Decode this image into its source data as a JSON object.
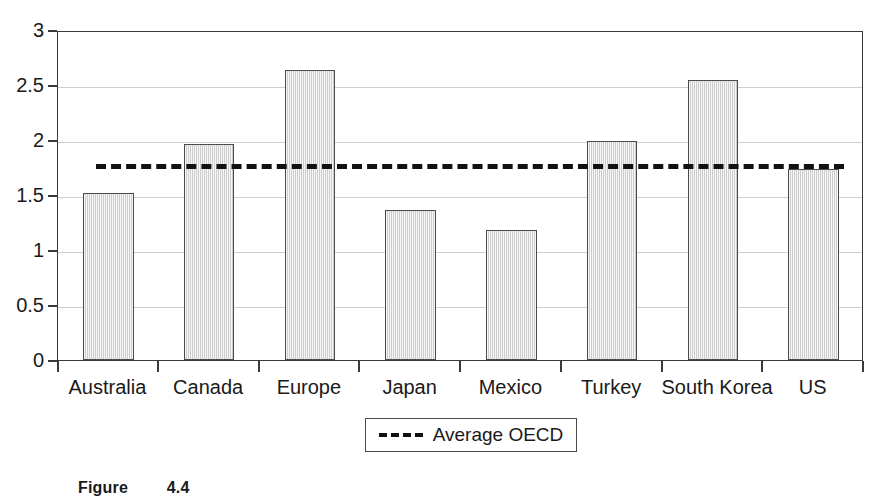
{
  "chart_data": {
    "type": "bar",
    "title": "",
    "xlabel": "",
    "ylabel": "",
    "ylim": [
      0,
      3
    ],
    "ytick_step": 0.5,
    "yticks": [
      "3",
      "2.5",
      "2",
      "1.5",
      "1",
      "0.5",
      "0"
    ],
    "ytick_values": [
      3,
      2.5,
      2,
      1.5,
      1,
      0.5,
      0
    ],
    "grid": true,
    "legend_position": "below-center",
    "categories": [
      "Australia",
      "Canada",
      "Europe",
      "Japan",
      "Mexico",
      "Turkey",
      "South Korea",
      "US"
    ],
    "values": [
      1.52,
      1.96,
      2.64,
      1.36,
      1.18,
      1.99,
      2.55,
      1.74
    ],
    "series": [
      {
        "name": "Country value",
        "values": [
          1.52,
          1.96,
          2.64,
          1.36,
          1.18,
          1.99,
          2.55,
          1.74
        ]
      }
    ],
    "reference_line": {
      "label": "Average OECD",
      "value": 1.8,
      "style": "dashed",
      "color": "#111111"
    },
    "colors": {
      "bar_fill": "#dedede",
      "bar_border": "#4a4a4a",
      "grid": "#cfcfcf",
      "frame": "#3a3a3a",
      "text": "#1a1a1a"
    }
  },
  "legend": {
    "entries": [
      {
        "label": "Average OECD",
        "marker": "dashed-line"
      }
    ]
  },
  "caption": {
    "prefix": "Figure",
    "number": "4.4"
  }
}
